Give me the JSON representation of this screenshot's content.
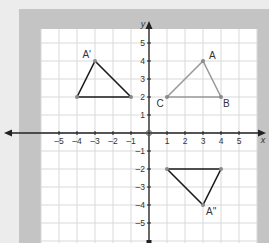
{
  "diagram": {
    "type": "coordinate_plane_transformations",
    "axes": {
      "x_label": "x",
      "y_label": "y",
      "x_ticks": [
        -5,
        -4,
        -3,
        -2,
        -1,
        1,
        2,
        3,
        4,
        5
      ],
      "y_ticks": [
        5,
        4,
        3,
        2,
        1,
        -1,
        -2,
        -3,
        -4,
        -5
      ],
      "x_tick_labels": [
        "–5",
        "–4",
        "–3",
        "–2",
        "–1",
        "1",
        "2",
        "3",
        "4",
        "5"
      ],
      "y_tick_labels": [
        "5",
        "4",
        "3",
        "2",
        "1",
        "–1",
        "–2",
        "–3",
        "–4",
        "–5"
      ],
      "origin_label": "0"
    },
    "colors": {
      "background": "#ececec",
      "frame": "#c4c4c4",
      "grid_bg": "#ffffff",
      "grid_line": "#d9d9d9",
      "axis": "#222222",
      "original_triangle": "#9a9a9a",
      "image_triangle": "#1a1a1a",
      "point": "#8a8a8a"
    },
    "triangles": [
      {
        "name": "ABC",
        "style": "gray",
        "vertices": [
          {
            "label": "A",
            "x": 3,
            "y": 4
          },
          {
            "label": "B",
            "x": 4,
            "y": 2
          },
          {
            "label": "C",
            "x": 1,
            "y": 2
          }
        ]
      },
      {
        "name": "A'B'C'",
        "style": "black",
        "vertices": [
          {
            "label": "A'",
            "x": -3,
            "y": 4
          },
          {
            "label": "",
            "x": -4,
            "y": 2
          },
          {
            "label": "",
            "x": -1,
            "y": 2
          }
        ]
      },
      {
        "name": "A''B''C''",
        "style": "black",
        "vertices": [
          {
            "label": "A''",
            "x": 3,
            "y": -4
          },
          {
            "label": "",
            "x": 4,
            "y": -2
          },
          {
            "label": "",
            "x": 1,
            "y": -2
          }
        ]
      }
    ]
  }
}
